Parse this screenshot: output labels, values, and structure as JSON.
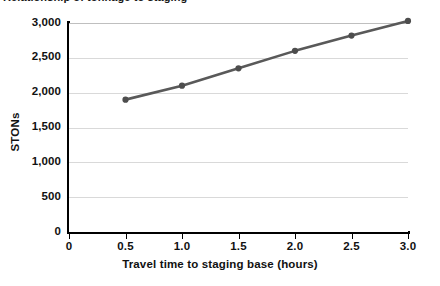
{
  "figure": {
    "title_partial": "Relationship of tonnage to staging"
  },
  "chart_data": {
    "type": "line",
    "title": "Relationship of tonnage to staging",
    "xlabel": "Travel time to staging base (hours)",
    "ylabel": "STONs",
    "x": [
      0.5,
      1.0,
      1.5,
      2.0,
      2.5,
      3.0
    ],
    "values": [
      1900,
      2100,
      2350,
      2600,
      2820,
      3030
    ],
    "series": [
      {
        "name": "STONs",
        "values": [
          1900,
          2100,
          2350,
          2600,
          2820,
          3030
        ]
      }
    ],
    "xlim": [
      0,
      3.0
    ],
    "ylim": [
      0,
      3000
    ],
    "xticks": [
      0,
      0.5,
      1.0,
      1.5,
      2.0,
      2.5,
      3.0
    ],
    "xtick_labels": [
      "0",
      "0.5",
      "1.0",
      "1.5",
      "2.0",
      "2.5",
      "3.0"
    ],
    "yticks": [
      0,
      500,
      1000,
      1500,
      2000,
      2500,
      3000
    ],
    "ytick_labels": [
      "0",
      "500",
      "1,000",
      "1,500",
      "2,000",
      "2,500",
      "3,000"
    ],
    "grid": "horizontal",
    "legend": "none",
    "line_color": "#595959",
    "marker_color": "#4d4d4d",
    "grid_color": "#d9d9d9",
    "axis_color": "#000000"
  }
}
